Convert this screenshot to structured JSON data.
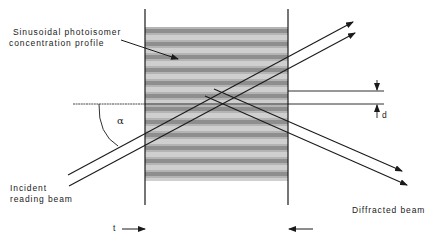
{
  "diagram": {
    "labels": {
      "profile_line1": "Sinusoidal  photoisomer",
      "profile_line2": "concentration   profile",
      "incident_line1": "Incident",
      "incident_line2": "reading  beam",
      "diffracted": "Diffracted    beam",
      "alpha": "α",
      "d": "d",
      "t": "t"
    },
    "grating": {
      "left_x": 145,
      "right_x": 288,
      "top_y": 27,
      "bottom_y": 181,
      "period_px": 13,
      "dark_band_color": "#8e8e8e",
      "light_band_color": "#cfcfcf"
    },
    "colors": {
      "line": "#1a1a1a",
      "background": "#ffffff"
    }
  }
}
